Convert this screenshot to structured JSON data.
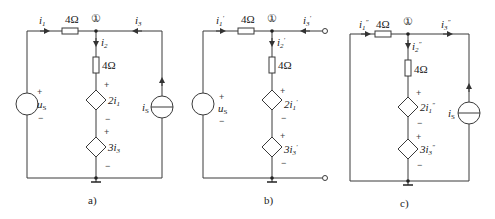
{
  "figures": [
    {
      "id": "a",
      "caption": "a)",
      "node_label": "①",
      "resistor_series": "4Ω",
      "resistor_branch": "4Ω",
      "currents": {
        "i1": "i",
        "i1_sub": "1",
        "i2": "i",
        "i2_sub": "2",
        "i3": "i",
        "i3_sub": "3"
      },
      "voltage_source": {
        "label": "u",
        "sub": "S",
        "plus": "+",
        "minus": "−"
      },
      "dep_source_1": {
        "label": "2i",
        "sub": "1",
        "plus": "+",
        "minus": "−"
      },
      "dep_source_2": {
        "label": "3i",
        "sub": "3",
        "plus": "+",
        "minus": "−"
      },
      "current_source": {
        "label": "i",
        "sub": "S"
      }
    },
    {
      "id": "b",
      "caption": "b)",
      "node_label": "①",
      "resistor_series": "4Ω",
      "resistor_branch": "4Ω",
      "currents": {
        "i1": "i",
        "i1_sub": "1",
        "i1_prime": "′",
        "i2": "i",
        "i2_sub": "2",
        "i2_prime": "′",
        "i3": "i",
        "i3_sub": "3",
        "i3_prime": "′"
      },
      "voltage_source": {
        "label": "u",
        "sub": "S",
        "plus": "+",
        "minus": "−"
      },
      "dep_source_1": {
        "label": "2i",
        "sub": "1",
        "prime": "′",
        "plus": "+",
        "minus": "−"
      },
      "dep_source_2": {
        "label": "3i",
        "sub": "3",
        "prime": "′",
        "plus": "+",
        "minus": "−"
      }
    },
    {
      "id": "c",
      "caption": "c)",
      "node_label": "①",
      "resistor_series": "4Ω",
      "resistor_branch": "4Ω",
      "currents": {
        "i1": "i",
        "i1_sub": "1",
        "i1_prime": "″",
        "i2": "i",
        "i2_sub": "2",
        "i2_prime": "″",
        "i3": "i",
        "i3_sub": "3",
        "i3_prime": "″"
      },
      "dep_source_1": {
        "label": "2i",
        "sub": "1",
        "prime": "″",
        "plus": "+",
        "minus": "−"
      },
      "dep_source_2": {
        "label": "3i",
        "sub": "3",
        "prime": "″",
        "plus": "+",
        "minus": "−"
      },
      "current_source": {
        "label": "i",
        "sub": "S"
      }
    }
  ]
}
